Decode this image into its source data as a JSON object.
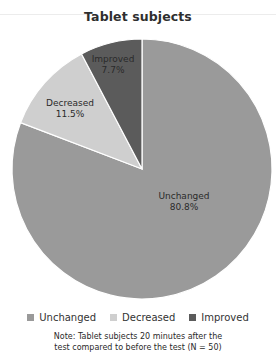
{
  "chart_data": {
    "type": "pie",
    "title": "Tablet subjects",
    "categories": [
      "Unchanged",
      "Decreased",
      "Improved"
    ],
    "values": [
      80.8,
      11.5,
      7.7
    ],
    "value_labels": [
      "80.8%",
      "11.5%",
      "7.7%"
    ],
    "colors": [
      "#9a9a9a",
      "#cfcfcf",
      "#5b5b5b"
    ],
    "start_angle_deg": 0,
    "direction": "clockwise-from-top (Unchanged), Improved ends at top",
    "legend_position": "bottom",
    "note": "Note: Tablet subjects 20 minutes after the test compared to before the test (N = 50)"
  },
  "header": {
    "title": "Tablet subjects"
  },
  "slices": [
    {
      "name": "Unchanged",
      "pct": "80.8%"
    },
    {
      "name": "Decreased",
      "pct": "11.5%"
    },
    {
      "name": "Improved",
      "pct": "7.7%"
    }
  ],
  "legend": {
    "items": [
      {
        "label": "Unchanged",
        "color": "#9a9a9a"
      },
      {
        "label": "Decreased",
        "color": "#cfcfcf"
      },
      {
        "label": "Improved",
        "color": "#5b5b5b"
      }
    ]
  },
  "note": {
    "line1": "Note: Tablet subjects 20 minutes after the",
    "line2": "test compared to before the test (N = 50)"
  }
}
